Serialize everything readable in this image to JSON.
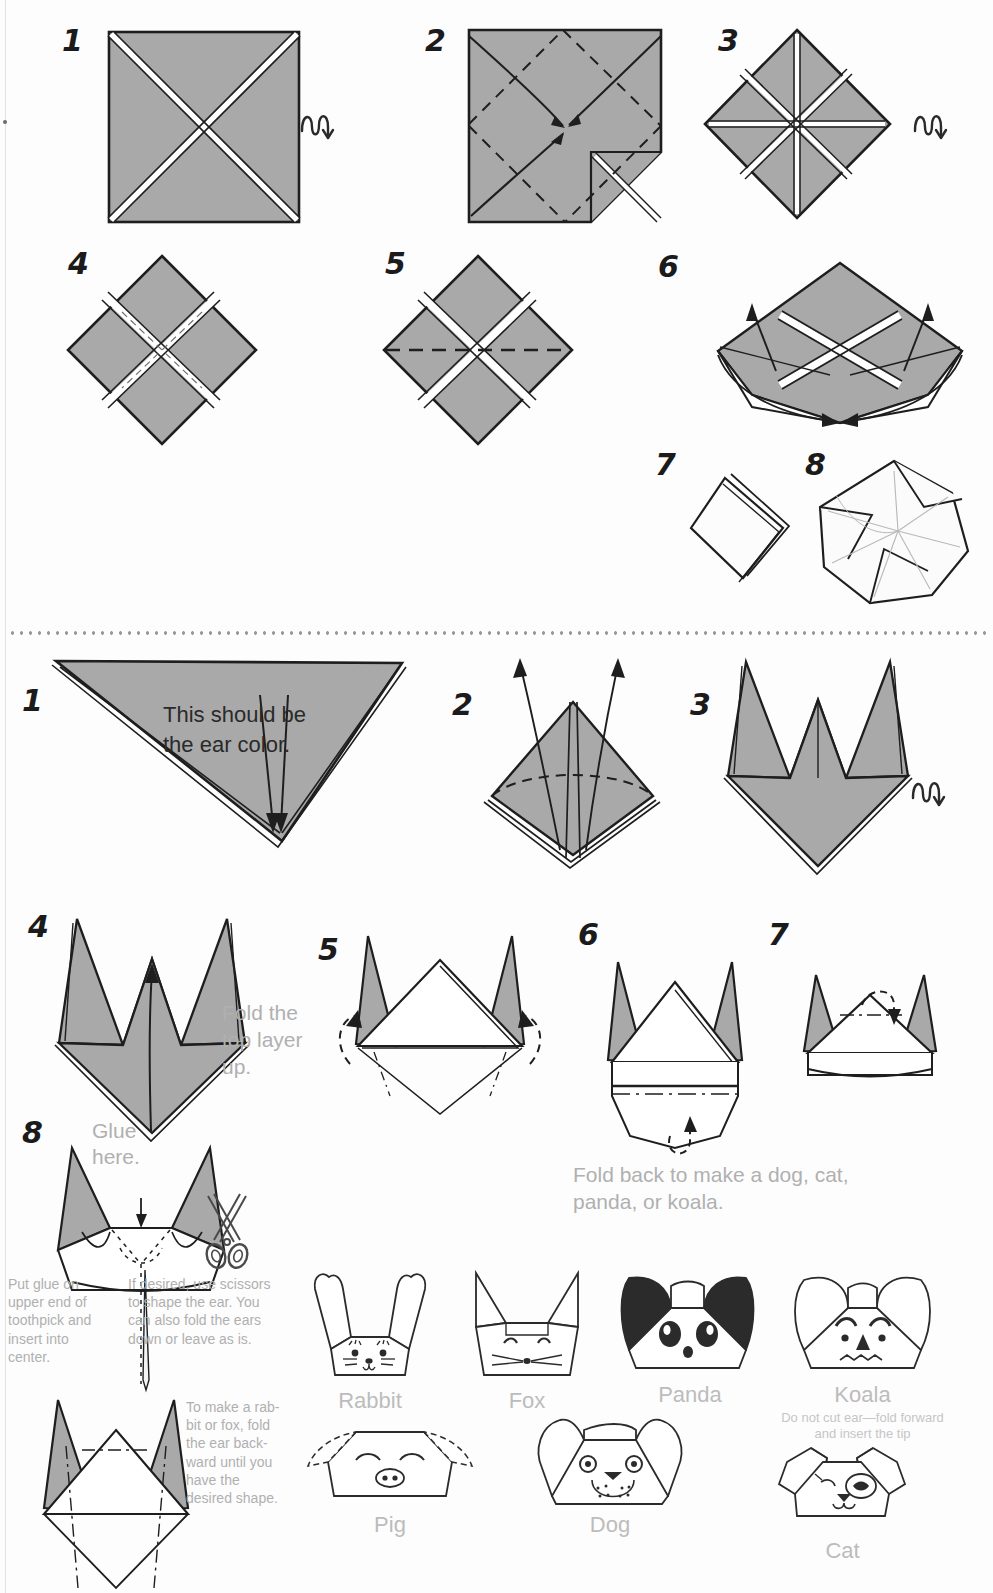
{
  "document": {
    "kind": "origami-instruction-diagram",
    "title": "Animal Head Origami Instructions",
    "paper_fill": "#a9a9a9",
    "ink": "#1e1e1e",
    "note_color": "#b0b0b0"
  },
  "section_one": {
    "steps": [
      {
        "number": "1",
        "flip_icon": "flip-over-icon"
      },
      {
        "number": "2"
      },
      {
        "number": "3",
        "flip_icon": "flip-over-icon"
      },
      {
        "number": "4"
      },
      {
        "number": "5"
      },
      {
        "number": "6"
      },
      {
        "number": "7"
      },
      {
        "number": "8"
      }
    ]
  },
  "section_two": {
    "steps": [
      {
        "number": "1",
        "note": "This should be\nthe ear color."
      },
      {
        "number": "2"
      },
      {
        "number": "3",
        "flip_icon": "flip-over-icon"
      },
      {
        "number": "4",
        "note": "Fold the\ntop layer\nup."
      },
      {
        "number": "5"
      },
      {
        "number": "6",
        "note": "Fold back to make a dog, cat,\npanda, or koala."
      },
      {
        "number": "7"
      },
      {
        "number": "8",
        "glue_label": "Glue\nhere.",
        "note_left": "Put glue on\nupper end of\ntoothpick and\ninsert into\ncenter.",
        "note_right": "If desired, use scissors\nto shape the ear. You\ncan also fold the ears\ndown or leave as is."
      }
    ],
    "rabbit_fox_note": "To make a rab-\nbit or fox, fold\nthe ear back-\nward until you\nhave the\ndesired shape."
  },
  "animals": [
    {
      "name": "Rabbit",
      "sub": ""
    },
    {
      "name": "Fox",
      "sub": ""
    },
    {
      "name": "Panda",
      "sub": ""
    },
    {
      "name": "Koala",
      "sub": "Do not cut ear—fold forward\nand insert the tip"
    },
    {
      "name": "Pig",
      "sub": ""
    },
    {
      "name": "Dog",
      "sub": ""
    },
    {
      "name": "Cat",
      "sub": ""
    }
  ]
}
